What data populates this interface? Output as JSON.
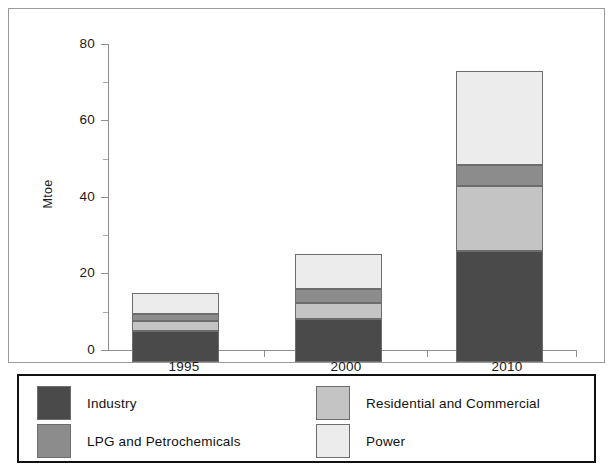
{
  "chart_data": {
    "type": "bar",
    "subtype": "stacked-bar",
    "title": "",
    "xlabel": "",
    "ylabel": "Mtoe",
    "categories": [
      "1995",
      "2000",
      "2010"
    ],
    "ylim": [
      0,
      80
    ],
    "y_major_ticks": [
      0,
      20,
      40,
      60,
      80
    ],
    "y_minor_ticks": [
      10,
      30,
      50,
      70
    ],
    "y_tick_labels": [
      "0",
      "20",
      "40",
      "60",
      "80"
    ],
    "grid": false,
    "legend_position": "bottom",
    "stack_order_bottom_to_top": [
      "Industry",
      "Residential and Commercial",
      "LPG and Petrochemicals",
      "Power"
    ],
    "series": [
      {
        "name": "Industry",
        "color": "#4a4a4a",
        "values": [
          8.0,
          11.2,
          29.0
        ]
      },
      {
        "name": "Residential and Commercial",
        "color": "#c4c4c4",
        "values": [
          2.7,
          4.3,
          17.0
        ]
      },
      {
        "name": "LPG and Petrochemicals",
        "color": "#8c8c8c",
        "values": [
          1.8,
          3.7,
          5.5
        ]
      },
      {
        "name": "Power",
        "color": "#ececec",
        "values": [
          5.5,
          9.0,
          24.5
        ]
      }
    ],
    "totals": [
      18.0,
      28.2,
      76.0
    ]
  },
  "axis": {
    "y_title": "Mtoe",
    "y_labels": {
      "t80": "80",
      "t60": "60",
      "t40": "40",
      "t20": "20",
      "t0": "0"
    },
    "x_labels": {
      "c0": "1995",
      "c1": "2000",
      "c2": "2010"
    }
  },
  "legend": {
    "entries": [
      {
        "label": "Industry",
        "color": "#4a4a4a"
      },
      {
        "label": "LPG and Petrochemicals",
        "color": "#8c8c8c"
      },
      {
        "label": "Residential and Commercial",
        "color": "#c4c4c4"
      },
      {
        "label": "Power",
        "color": "#ececec"
      }
    ]
  },
  "colors": {
    "industry": "#4a4a4a",
    "lpg_and_petrochemicals": "#8c8c8c",
    "residential_and_commercial": "#c4c4c4",
    "power": "#ececec",
    "axis": "#8d8d8d",
    "segment_border": "#6d6d6d",
    "frame": "#9a9a9a",
    "legend_border": "#111111",
    "background": "#ffffff"
  }
}
